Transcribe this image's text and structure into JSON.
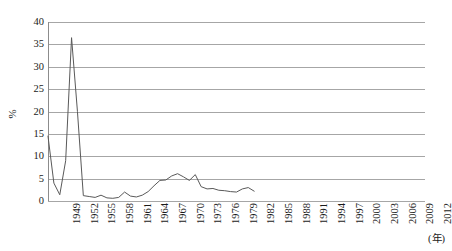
{
  "chart_data": {
    "type": "line",
    "title": "",
    "subtitle": "",
    "xlabel": "(年)",
    "ylabel": "%",
    "grid": true,
    "legend": false,
    "legend_position": "none",
    "xlim": [
      1949,
      2013
    ],
    "ylim": [
      0,
      40
    ],
    "ytick_labels": [
      "0",
      "5",
      "10",
      "15",
      "20",
      "25",
      "30",
      "35",
      "40"
    ],
    "ytick_values": [
      0,
      5,
      10,
      15,
      20,
      25,
      30,
      35,
      40
    ],
    "xtick_labels": [
      "1949",
      "1952",
      "1955",
      "1958",
      "1961",
      "1964",
      "1967",
      "1970",
      "1973",
      "1976",
      "1979",
      "1982",
      "1985",
      "1988",
      "1991",
      "1994",
      "1997",
      "2000",
      "2003",
      "2006",
      "2009",
      "2012"
    ],
    "xtick_values": [
      1949,
      1952,
      1955,
      1958,
      1961,
      1964,
      1967,
      1970,
      1973,
      1976,
      1979,
      1982,
      1985,
      1988,
      1991,
      1994,
      1997,
      2000,
      2003,
      2006,
      2009,
      2012
    ],
    "series": [
      {
        "name": "series-1",
        "color": "#595959",
        "x": [
          1949,
          1950,
          1951,
          1952,
          1953,
          1954,
          1955,
          1956,
          1957,
          1958,
          1959,
          1960,
          1961,
          1962,
          1963,
          1964,
          1965,
          1966,
          1967,
          1968,
          1969,
          1970,
          1971,
          1972,
          1973,
          1974,
          1975,
          1976,
          1977,
          1978,
          1979,
          1980,
          1981,
          1982,
          1983,
          1984
        ],
        "values": [
          14.5,
          4.0,
          1.4,
          9.0,
          36.5,
          20.0,
          1.2,
          1.0,
          0.8,
          1.3,
          0.7,
          0.6,
          0.8,
          2.0,
          1.1,
          0.9,
          1.3,
          2.1,
          3.4,
          4.6,
          4.7,
          5.6,
          6.1,
          5.4,
          4.6,
          5.9,
          3.2,
          2.7,
          2.8,
          2.4,
          2.3,
          2.1,
          2.0,
          2.7,
          3.0,
          2.2
        ]
      }
    ]
  }
}
